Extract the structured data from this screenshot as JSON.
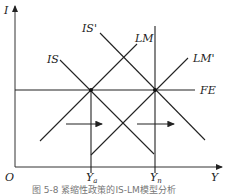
{
  "axes": {
    "y_label": "I",
    "x_label": "Y",
    "origin_label": "O"
  },
  "curves": {
    "is": "IS",
    "is_shift": "IS'",
    "lm": "LM",
    "lm_shift": "LM'",
    "fe": "FE"
  },
  "ticks": {
    "y_a": "Y",
    "y_a_sub": "a",
    "y_n": "Y",
    "y_n_sub": "n"
  },
  "caption": "图 5-8  紧缩性政策的IS-LM模型分析",
  "colors": {
    "line": "#222222",
    "background": "#ffffff"
  }
}
